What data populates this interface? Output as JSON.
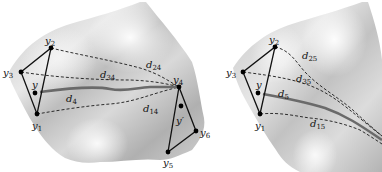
{
  "figure": {
    "panels": [
      {
        "id": "left",
        "points": {
          "y1": {
            "label": "y",
            "sub": "1",
            "x": 37,
            "y": 114
          },
          "y2": {
            "label": "y",
            "sub": "2",
            "x": 51,
            "y": 48
          },
          "y3": {
            "label": "y",
            "sub": "3",
            "x": 21,
            "y": 72
          },
          "y": {
            "label": "y",
            "sub": "",
            "x": 35,
            "y": 93
          },
          "y4": {
            "label": "y",
            "sub": "4",
            "x": 179,
            "y": 87
          },
          "y5": {
            "label": "y",
            "sub": "5",
            "x": 168,
            "y": 152
          },
          "y6": {
            "label": "y",
            "sub": "6",
            "x": 196,
            "y": 131
          },
          "yprime": {
            "label": "y′",
            "sub": "",
            "x": 181,
            "y": 106
          }
        },
        "distance_labels": {
          "d24": {
            "label": "d",
            "sub": "24"
          },
          "d34": {
            "label": "d",
            "sub": "34"
          },
          "d4": {
            "label": "d",
            "sub": "4"
          },
          "d14": {
            "label": "d",
            "sub": "14"
          }
        }
      },
      {
        "id": "right",
        "points": {
          "y1": {
            "label": "y",
            "sub": "1",
            "x": 260,
            "y": 114
          },
          "y2": {
            "label": "y",
            "sub": "2",
            "x": 275,
            "y": 47
          },
          "y3": {
            "label": "y",
            "sub": "3",
            "x": 243,
            "y": 72
          },
          "y": {
            "label": "y",
            "sub": "",
            "x": 258,
            "y": 93
          }
        },
        "distance_labels": {
          "d25": {
            "label": "d",
            "sub": "25"
          },
          "d35": {
            "label": "d",
            "sub": "35"
          },
          "d5": {
            "label": "d",
            "sub": "5"
          },
          "d15": {
            "label": "d",
            "sub": "15"
          }
        }
      }
    ],
    "colors": {
      "surface_light": "#f4f4f4",
      "surface_dark": "#a8a8a8",
      "geodesic_main": "#6a6a6a",
      "dashed": "#1a1a1a",
      "point": "#000000"
    }
  }
}
